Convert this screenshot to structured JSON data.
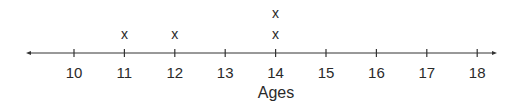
{
  "chart_data": {
    "type": "dot_plot",
    "title": "",
    "xlabel": "Ages",
    "ylabel": "",
    "x_range": [
      10,
      18
    ],
    "categories": [
      10,
      11,
      12,
      13,
      14,
      15,
      16,
      17,
      18
    ],
    "tick_labels": [
      "10",
      "11",
      "12",
      "13",
      "14",
      "15",
      "16",
      "17",
      "18"
    ],
    "counts": [
      0,
      1,
      1,
      0,
      2,
      0,
      0,
      0,
      0
    ],
    "marker": "x",
    "data_points": [
      11,
      12,
      14,
      14
    ],
    "grid": false,
    "legend": null,
    "axis": {
      "left_arrow": true,
      "right_arrow": true
    }
  },
  "style": {
    "line_color": "#333333",
    "text_color": "#2a2a2a"
  }
}
